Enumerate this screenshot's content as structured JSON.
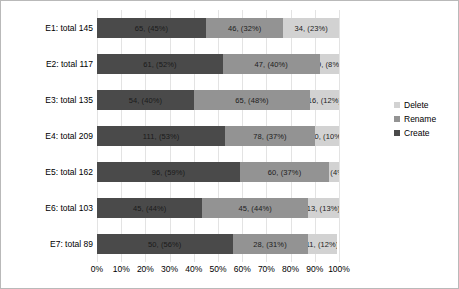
{
  "chart_data": {
    "type": "bar",
    "subtype": "horizontal-stacked-100pct",
    "title": "",
    "xlabel": "",
    "ylabel": "",
    "categories": [
      "E1: total 145",
      "E2: total 117",
      "E3: total 135",
      "E4: total 209",
      "E5: total 162",
      "E6: total 103",
      "E7: total 89"
    ],
    "category_totals": [
      145,
      117,
      135,
      209,
      162,
      103,
      89
    ],
    "xlim": [
      0,
      100
    ],
    "xticks": [
      "0%",
      "10%",
      "20%",
      "30%",
      "40%",
      "50%",
      "60%",
      "70%",
      "80%",
      "90%",
      "100%"
    ],
    "grid": true,
    "legend_position": "right",
    "series": [
      {
        "name": "Create",
        "color": "#4a4a4a",
        "values": [
          65,
          61,
          54,
          111,
          96,
          45,
          50
        ],
        "percents": [
          45,
          52,
          40,
          53,
          59,
          44,
          56
        ],
        "labels": [
          "65, (45%)",
          "61, (52%)",
          "54, (40%)",
          "111, (53%)",
          "96, (59%)",
          "45, (44%)",
          "50, (56%)"
        ]
      },
      {
        "name": "Rename",
        "color": "#939393",
        "values": [
          46,
          47,
          65,
          78,
          60,
          45,
          28
        ],
        "percents": [
          32,
          40,
          48,
          37,
          37,
          44,
          31
        ],
        "labels": [
          "46, (32%)",
          "47, (40%)",
          "65, (48%)",
          "78, (37%)",
          "60, (37%)",
          "45, (44%)",
          "28, (31%)"
        ]
      },
      {
        "name": "Delete",
        "color": "#d2d2d2",
        "values": [
          34,
          9,
          16,
          20,
          6,
          13,
          11
        ],
        "percents": [
          23,
          8,
          12,
          10,
          4,
          13,
          12
        ],
        "labels": [
          "34, (23%)",
          "9, (8%)",
          "16, (12%)",
          "20, (10%)",
          "6, (4%)",
          "13, (13%)",
          "11, (12%)"
        ]
      }
    ],
    "legend_order": [
      "Delete",
      "Rename",
      "Create"
    ]
  }
}
